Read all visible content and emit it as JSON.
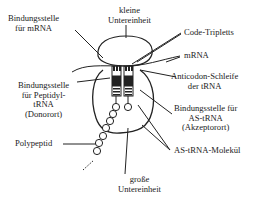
{
  "diagram": {
    "colors": {
      "line": "#222222",
      "text": "#222222",
      "background": "#ffffff"
    },
    "labels": {
      "mrna_binding_site": [
        "Bindungsstelle",
        "für mRNA"
      ],
      "small_subunit": [
        "kleine",
        "Untereinheit"
      ],
      "code_triplets": "Code-Tripletts",
      "mrna": "mRNA",
      "anticodon_loop": [
        "Anticodon-Schleife",
        "der tRNA"
      ],
      "peptidyl_binding_site": [
        "Bindungsstelle",
        "für Peptidyl-",
        "tRNA",
        "(Donorort)"
      ],
      "aa_trna_binding_site": [
        "Bindungsstelle für",
        "AS-tRNA",
        "(Akzeptorort)"
      ],
      "polypeptide": "Polypeptid",
      "aa_trna_molecule": "AS-tRNA-Molekül",
      "large_subunit": [
        "große",
        "Untereinheit"
      ]
    }
  }
}
